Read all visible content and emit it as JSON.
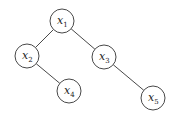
{
  "diagram": {
    "type": "binary-tree",
    "nodes": [
      {
        "id": "x1",
        "var": "x",
        "sub": "1",
        "cx": 62,
        "cy": 21
      },
      {
        "id": "x2",
        "var": "x",
        "sub": "2",
        "cx": 27,
        "cy": 56
      },
      {
        "id": "x3",
        "var": "x",
        "sub": "3",
        "cx": 104,
        "cy": 57
      },
      {
        "id": "x4",
        "var": "x",
        "sub": "4",
        "cx": 69,
        "cy": 91
      },
      {
        "id": "x5",
        "var": "x",
        "sub": "5",
        "cx": 153,
        "cy": 98
      }
    ],
    "edges": [
      {
        "from": "x1",
        "to": "x2"
      },
      {
        "from": "x1",
        "to": "x3"
      },
      {
        "from": "x2",
        "to": "x4"
      },
      {
        "from": "x3",
        "to": "x5"
      }
    ],
    "node_radius": 12
  }
}
